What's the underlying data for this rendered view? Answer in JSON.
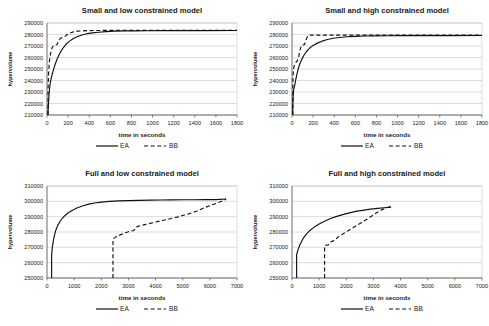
{
  "figure": {
    "name": "hypervolume-convergence-figure",
    "panel_count": 4,
    "series_names": [
      "EA",
      "BB"
    ],
    "colors": {
      "series_ea": "#111111",
      "series_bb": "#111111",
      "gridline": "#b9b9b9",
      "axis": "#4d4d4d",
      "background": "#ffffff",
      "text": "#1a1a1a"
    }
  },
  "chart_data": [
    {
      "id": "small-low",
      "type": "line",
      "title": "Small and low constrained model",
      "xlabel": "time in seconds",
      "ylabel": "hypervolume",
      "xlim": [
        0,
        1800
      ],
      "ylim": [
        210000,
        290000
      ],
      "xticks": [
        0,
        200,
        400,
        600,
        800,
        1000,
        1200,
        1400,
        1600,
        1800
      ],
      "yticks": [
        210000,
        220000,
        230000,
        240000,
        250000,
        260000,
        270000,
        280000,
        290000
      ],
      "grid": true,
      "legend": [
        "EA",
        "BB"
      ],
      "legend_position": "below-axis-title",
      "series": [
        {
          "name": "EA",
          "style": "solid",
          "x": [
            8,
            12,
            18,
            25,
            32,
            40,
            50,
            60,
            75,
            95,
            120,
            150,
            180,
            210,
            250,
            290,
            330,
            380,
            430,
            490,
            560,
            640,
            730,
            830,
            950,
            1100,
            1300,
            1500,
            1800
          ],
          "y": [
            210000,
            217000,
            226000,
            233500,
            238500,
            242000,
            245500,
            249000,
            253500,
            258500,
            263500,
            268000,
            271500,
            274000,
            276500,
            278200,
            279600,
            280700,
            281400,
            282000,
            282500,
            282900,
            283100,
            283200,
            283300,
            283350,
            283400,
            283420,
            283450
          ]
        },
        {
          "name": "BB",
          "style": "dashed",
          "x": [
            10,
            10,
            14,
            22,
            34,
            48,
            62,
            78,
            95,
            110,
            125,
            140,
            160,
            185,
            215,
            250,
            290,
            340,
            400,
            470,
            560,
            670,
            800,
            960,
            1150,
            1400,
            1650,
            1800
          ],
          "y": [
            210000,
            232000,
            245000,
            256000,
            263500,
            268500,
            270500,
            271000,
            271200,
            274500,
            276500,
            277200,
            277500,
            279500,
            281200,
            282300,
            282900,
            283200,
            283400,
            283500,
            283550,
            283580,
            283600,
            283620,
            283640,
            283650,
            283660,
            283660
          ]
        }
      ]
    },
    {
      "id": "small-high",
      "type": "line",
      "title": "Small and high constrained model",
      "xlabel": "time in seconds",
      "ylabel": "hypervolume",
      "xlim": [
        0,
        1800
      ],
      "ylim": [
        210000,
        290000
      ],
      "xticks": [
        0,
        200,
        400,
        600,
        800,
        1000,
        1200,
        1400,
        1600,
        1800
      ],
      "yticks": [
        210000,
        220000,
        230000,
        240000,
        250000,
        260000,
        270000,
        280000,
        290000
      ],
      "grid": true,
      "legend": [
        "EA",
        "BB"
      ],
      "legend_position": "below-axis-title",
      "series": [
        {
          "name": "EA",
          "style": "solid",
          "x": [
            6,
            8,
            12,
            16,
            20,
            26,
            34,
            44,
            56,
            70,
            88,
            110,
            135,
            165,
            200,
            240,
            285,
            335,
            390,
            450,
            520,
            600,
            690,
            790,
            900,
            1050,
            1250,
            1500,
            1800
          ],
          "y": [
            210000,
            219000,
            228000,
            232500,
            233500,
            236000,
            240000,
            244500,
            249000,
            253500,
            257500,
            261500,
            265000,
            268000,
            270500,
            272500,
            274200,
            275600,
            276700,
            277400,
            278000,
            278400,
            278700,
            278850,
            278950,
            279000,
            279050,
            279080,
            279100
          ]
        },
        {
          "name": "BB",
          "style": "dashed",
          "x": [
            8,
            8,
            10,
            14,
            20,
            28,
            38,
            50,
            62,
            76,
            90,
            104,
            118,
            130,
            142,
            155,
            175,
            210,
            270,
            360,
            500,
            700,
            950,
            1250,
            1550,
            1800
          ],
          "y": [
            210000,
            236000,
            244000,
            249500,
            252500,
            254500,
            256000,
            257000,
            260000,
            266500,
            270500,
            271000,
            271200,
            274500,
            277500,
            279200,
            279400,
            279450,
            279480,
            279500,
            279500,
            279500,
            279500,
            279500,
            279500,
            279500
          ]
        }
      ]
    },
    {
      "id": "full-low",
      "type": "line",
      "title": "Full and low constrained model",
      "xlabel": "time in seconds",
      "ylabel": "hypervolume",
      "xlim": [
        0,
        7000
      ],
      "ylim": [
        250000,
        310000
      ],
      "xticks": [
        0,
        1000,
        2000,
        3000,
        4000,
        5000,
        6000,
        7000
      ],
      "yticks": [
        250000,
        260000,
        270000,
        280000,
        290000,
        300000,
        310000
      ],
      "grid": true,
      "legend": [
        "EA",
        "BB"
      ],
      "legend_position": "below-axis-title",
      "series": [
        {
          "name": "EA",
          "style": "solid",
          "x": [
            170,
            170,
            200,
            250,
            320,
            400,
            500,
            620,
            760,
            920,
            1100,
            1300,
            1500,
            1750,
            2000,
            2300,
            2650,
            3000,
            3400,
            3800,
            4200,
            4600,
            5000,
            5400,
            5800,
            6200,
            6600
          ],
          "y": [
            250000,
            265000,
            270500,
            276000,
            281000,
            284500,
            287500,
            290000,
            292200,
            294000,
            295600,
            297000,
            298000,
            298900,
            299500,
            300000,
            300300,
            300500,
            300650,
            300800,
            300900,
            300950,
            301000,
            301050,
            301100,
            301150,
            301500
          ]
        },
        {
          "name": "BB",
          "style": "dashed",
          "x": [
            2430,
            2430,
            2520,
            2620,
            2750,
            2900,
            3050,
            3200,
            3320,
            3450,
            3600,
            3800,
            4000,
            4250,
            4500,
            4750,
            5000,
            5250,
            5500,
            5750,
            6000,
            6250,
            6450,
            6600
          ],
          "y": [
            250000,
            275500,
            276500,
            277500,
            278500,
            279500,
            280500,
            281000,
            283500,
            284200,
            284800,
            285600,
            286500,
            287500,
            288500,
            289500,
            290800,
            292000,
            293500,
            295500,
            297200,
            298800,
            300200,
            301300
          ]
        }
      ]
    },
    {
      "id": "full-high",
      "type": "line",
      "title": "Full and high constrained model",
      "xlabel": "time in seconds",
      "ylabel": "hypervolume",
      "xlim": [
        0,
        7000
      ],
      "ylim": [
        250000,
        310000
      ],
      "xticks": [
        0,
        1000,
        2000,
        3000,
        4000,
        5000,
        6000,
        7000
      ],
      "yticks": [
        250000,
        260000,
        270000,
        280000,
        290000,
        300000,
        310000
      ],
      "grid": true,
      "legend": [
        "EA",
        "BB"
      ],
      "legend_position": "below-axis-title",
      "series": [
        {
          "name": "EA",
          "style": "solid",
          "x": [
            170,
            170,
            220,
            300,
            400,
            520,
            660,
            820,
            1000,
            1200,
            1420,
            1650,
            1900,
            2150,
            2400,
            2650,
            2900,
            3150,
            3400,
            3650
          ],
          "y": [
            250000,
            265000,
            268500,
            272000,
            275500,
            278500,
            281000,
            283200,
            285200,
            287000,
            288800,
            290200,
            291500,
            292600,
            293600,
            294300,
            294900,
            295400,
            295800,
            296200
          ]
        },
        {
          "name": "BB",
          "style": "dashed",
          "x": [
            1200,
            1200,
            1260,
            1340,
            1430,
            1520,
            1620,
            1720,
            1830,
            1950,
            2080,
            2220,
            2380,
            2550,
            2730,
            2900,
            3050,
            3200,
            3320,
            3450,
            3600,
            3720
          ],
          "y": [
            250000,
            271000,
            271400,
            271600,
            273500,
            274200,
            275500,
            277000,
            278200,
            279500,
            281000,
            282500,
            284200,
            286000,
            288000,
            290000,
            291800,
            293400,
            294600,
            295600,
            296400,
            296600
          ]
        }
      ]
    }
  ]
}
